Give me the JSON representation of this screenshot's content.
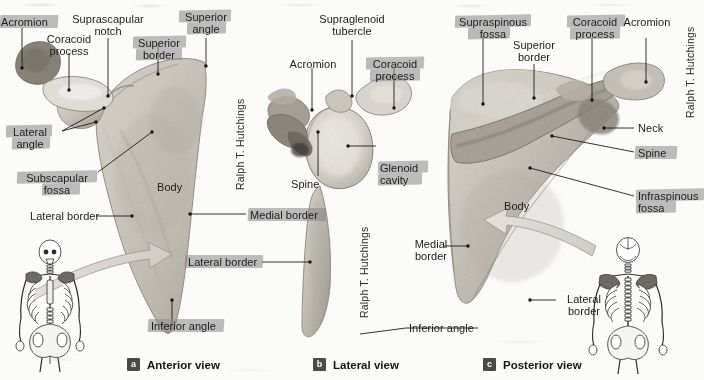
{
  "figure": {
    "credit": "Ralph T. Hutchings",
    "views": [
      {
        "key": "a",
        "badge": "a",
        "name": "Anterior view"
      },
      {
        "key": "b",
        "badge": "b",
        "name": "Lateral view"
      },
      {
        "key": "c",
        "badge": "c",
        "name": "Posterior view"
      }
    ]
  },
  "anterior": {
    "labels": {
      "acromion": "Acromion",
      "coracoid_process_l1": "Coracoid",
      "coracoid_process_l2": "process",
      "suprascapular_notch_l1": "Suprascapular",
      "suprascapular_notch_l2": "notch",
      "superior_border_l1": "Superior",
      "superior_border_l2": "border",
      "superior_angle_l1": "Superior",
      "superior_angle_l2": "angle",
      "lateral_angle_l1": "Lateral",
      "lateral_angle_l2": "angle",
      "subscapular_fossa_l1": "Subscapular",
      "subscapular_fossa_l2": "fossa",
      "lateral_border": "Lateral border",
      "medial_border": "Medial border",
      "body": "Body",
      "inferior_angle": "Inferior angle"
    }
  },
  "lateral": {
    "labels": {
      "supraglenoid_tubercle_l1": "Supraglenoid",
      "supraglenoid_tubercle_l2": "tubercle",
      "acromion": "Acromion",
      "coracoid_process_l1": "Coracoid",
      "coracoid_process_l2": "process",
      "spine": "Spine",
      "glenoid_cavity_l1": "Glenoid",
      "glenoid_cavity_l2": "cavity",
      "lateral_border": "Lateral border",
      "inferior_angle": "Inferior angle"
    }
  },
  "posterior": {
    "labels": {
      "supraspinous_fossa_l1": "Supraspinous",
      "supraspinous_fossa_l2": "fossa",
      "coracoid_process_l1": "Coracoid",
      "coracoid_process_l2": "process",
      "acromion": "Acromion",
      "superior_border_l1": "Superior",
      "superior_border_l2": "border",
      "neck": "Neck",
      "spine": "Spine",
      "infraspinous_fossa_l1": "Infraspinous",
      "infraspinous_fossa_l2": "fossa",
      "body": "Body",
      "medial_border_l1": "Medial",
      "medial_border_l2": "border",
      "lateral_border_l1": "Lateral",
      "lateral_border_l2": "border",
      "inferior_angle": "Inferior angle"
    }
  },
  "colors": {
    "highlight": "#8a8a8a",
    "text": "#1b1b1b",
    "leader": "#1d1d1d",
    "badge_bg": "#4a4a4a",
    "bone_light": "#e6e3dd",
    "bone_mid": "#c9c4bb",
    "bone_dark": "#9d978c",
    "arrow": "#d9d6d0"
  }
}
